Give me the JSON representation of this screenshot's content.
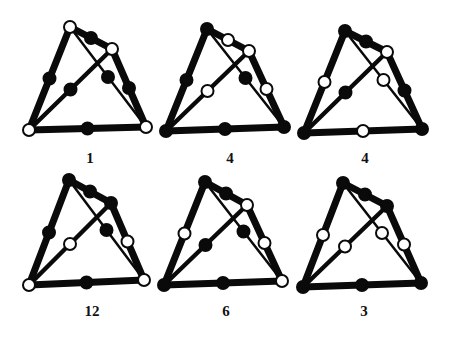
{
  "figures": [
    {
      "label": "1",
      "offset": [
        0,
        0
      ],
      "label_pos": [
        90,
        163
      ],
      "vertices": {
        "T": [
          70,
          27
        ],
        "UR": [
          112,
          49
        ],
        "BL": [
          29,
          130
        ],
        "BR": [
          146,
          127
        ]
      },
      "vertex_fill": {
        "T": "white",
        "UR": "white",
        "BL": "white",
        "BR": "white"
      },
      "midpoints": {
        "T_UR": "black",
        "T_BL": "black",
        "UR_BR": "black",
        "BL_BR": "black",
        "BL_UR": "black",
        "T_BR": "black"
      }
    },
    {
      "label": "4",
      "offset": [
        0,
        0
      ],
      "label_pos": [
        230,
        163
      ],
      "vertices": {
        "T": [
          207,
          29
        ],
        "UR": [
          249,
          51
        ],
        "BL": [
          166,
          131
        ],
        "BR": [
          284,
          127
        ]
      },
      "vertex_fill": {
        "T": "black",
        "UR": "white",
        "BL": "black",
        "BR": "black"
      },
      "midpoints": {
        "T_UR": "white",
        "T_BL": "black",
        "UR_BR": "white",
        "BL_BR": "black",
        "BL_UR": "white",
        "T_BR": "black"
      }
    },
    {
      "label": "4",
      "offset": [
        0,
        0
      ],
      "label_pos": [
        365,
        163
      ],
      "vertices": {
        "T": [
          345,
          31
        ],
        "UR": [
          387,
          52
        ],
        "BL": [
          304,
          133
        ],
        "BR": [
          422,
          129
        ]
      },
      "vertex_fill": {
        "T": "black",
        "UR": "white",
        "BL": "black",
        "BR": "black"
      },
      "midpoints": {
        "T_UR": "black",
        "T_BL": "white",
        "UR_BR": "black",
        "BL_BR": "white",
        "BL_UR": "black",
        "T_BR": "white"
      }
    },
    {
      "label": "12",
      "offset": [
        0,
        0
      ],
      "label_pos": [
        92,
        316
      ],
      "vertices": {
        "T": [
          69,
          180
        ],
        "UR": [
          111,
          203
        ],
        "BL": [
          29,
          285
        ],
        "BR": [
          144,
          280
        ]
      },
      "vertex_fill": {
        "T": "black",
        "UR": "black",
        "BL": "white",
        "BR": "white"
      },
      "midpoints": {
        "T_UR": "black",
        "T_BL": "black",
        "UR_BR": "white",
        "BL_BR": "black",
        "BL_UR": "white",
        "T_BR": "black"
      }
    },
    {
      "label": "6",
      "offset": [
        0,
        0
      ],
      "label_pos": [
        226,
        316
      ],
      "vertices": {
        "T": [
          205,
          182
        ],
        "UR": [
          247,
          205
        ],
        "BL": [
          164,
          285
        ],
        "BR": [
          282,
          281
        ]
      },
      "vertex_fill": {
        "T": "black",
        "UR": "white",
        "BL": "black",
        "BR": "white"
      },
      "midpoints": {
        "T_UR": "black",
        "T_BL": "white",
        "UR_BR": "white",
        "BL_BR": "black",
        "BL_UR": "black",
        "T_BR": "black"
      }
    },
    {
      "label": "3",
      "offset": [
        0,
        0
      ],
      "label_pos": [
        364,
        316
      ],
      "vertices": {
        "T": [
          343,
          183
        ],
        "UR": [
          387,
          206
        ],
        "BL": [
          303,
          287
        ],
        "BR": [
          421,
          283
        ]
      },
      "vertex_fill": {
        "T": "black",
        "UR": "black",
        "BL": "black",
        "BR": "black"
      },
      "midpoints": {
        "T_UR": "black",
        "T_BL": "white",
        "UR_BR": "white",
        "BL_BR": "black",
        "BL_UR": "white",
        "T_BR": "white"
      }
    }
  ],
  "style": {
    "stroke": "#0a0a0a",
    "edge_widths": {
      "T_UR": 7,
      "T_BL": 7,
      "UR_BR": 7,
      "BL_BR": 7,
      "BL_UR": 4.5,
      "T_BR": 2.5
    },
    "node_radius": 6
  }
}
